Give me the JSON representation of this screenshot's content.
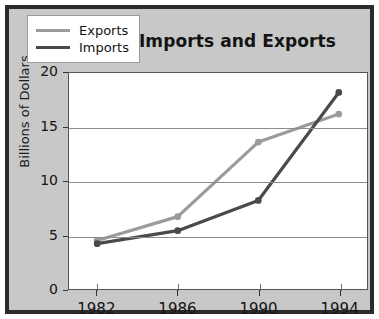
{
  "chart_data": {
    "type": "line",
    "title": "Poland's Imports and Exports",
    "xlabel": "",
    "ylabel": "Billions of Dollars",
    "categories": [
      "1982",
      "1986",
      "1990",
      "1994"
    ],
    "x": [
      1982,
      1986,
      1990,
      1994
    ],
    "xlim": [
      1980.6,
      1995.4
    ],
    "ylim": [
      0,
      20
    ],
    "yticks": [
      0,
      5,
      10,
      15,
      20
    ],
    "ytick_labels": [
      "0",
      "5",
      "10",
      "15",
      "20"
    ],
    "xtick_labels": [
      "1982",
      "1986",
      "1990",
      "1994"
    ],
    "grid": "horizontal",
    "legend_position": "top-left",
    "series": [
      {
        "name": "Exports",
        "color": "#9b9b9b",
        "values": [
          4.5,
          6.7,
          13.6,
          16.2
        ]
      },
      {
        "name": "Imports",
        "color": "#4a4a4a",
        "values": [
          4.2,
          5.4,
          8.2,
          18.2
        ]
      }
    ]
  },
  "figure": {
    "background_color": "#c8c8c8",
    "plot_background_color": "#ffffff",
    "border_color": "#2b2b2b",
    "gridline_color": "#8c8c8c"
  },
  "legend": {
    "entries": [
      {
        "label": "Exports",
        "color": "#9b9b9b"
      },
      {
        "label": "Imports",
        "color": "#4a4a4a"
      }
    ]
  }
}
